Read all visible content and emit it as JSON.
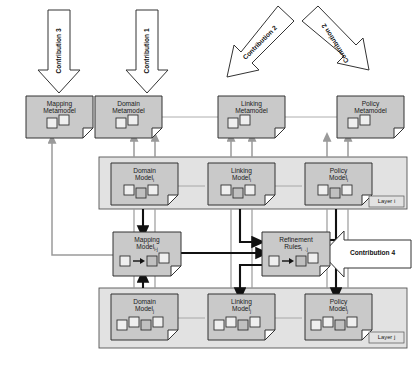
{
  "diagram": {
    "colors": {
      "doc_fill": "#c9c9c9",
      "doc_stroke": "#333333",
      "group_fill": "#e2e2e2",
      "group_stroke": "#555555",
      "arrow_gray": "#9a9a9a",
      "arrow_black": "#111111",
      "line_gray": "#9a9a9a",
      "contrib_fill": "#ffffff",
      "contrib_stroke": "#333333",
      "text": "#1a1a1a",
      "background": "#ffffff"
    },
    "contributions": [
      {
        "id": "contribution-3",
        "label": "Contribution 3",
        "direction": "down",
        "target": "Mapping Metamodel"
      },
      {
        "id": "contribution-1",
        "label": "Contribution 1",
        "direction": "down",
        "target": "Domain Metamodel"
      },
      {
        "id": "contribution-2-left",
        "label": "Contribution 2",
        "direction": "down-left",
        "target": "Linking Metamodel"
      },
      {
        "id": "contribution-2-right",
        "label": "Contribution 2",
        "direction": "down-right",
        "target": "Policy Metamodel"
      },
      {
        "id": "contribution-4",
        "label": "Contribution 4",
        "direction": "left",
        "target": "Refinement Rules"
      }
    ],
    "metamodels": [
      {
        "id": "mapping-metamodel",
        "line1": "Mapping",
        "line2": "Metamodel",
        "subscript": "",
        "shapes": 2
      },
      {
        "id": "domain-metamodel",
        "line1": "Domain",
        "line2": "Metamodel",
        "subscript": "",
        "shapes": 2
      },
      {
        "id": "linking-metamodel",
        "line1": "Linking",
        "line2": "Metamodel",
        "subscript": "",
        "shapes": 2
      },
      {
        "id": "policy-metamodel",
        "line1": "Policy",
        "line2": "Metamodel",
        "subscript": "",
        "shapes": 2
      }
    ],
    "layers": [
      {
        "id": "layer-i",
        "label": "Layer i",
        "models": [
          {
            "id": "domain-model-i",
            "line1": "Domain",
            "line2": "Model",
            "subscript": "i",
            "shapes": 3
          },
          {
            "id": "linking-model-i",
            "line1": "Linking",
            "line2": "Model",
            "subscript": "i",
            "shapes": 3
          },
          {
            "id": "policy-model-i",
            "line1": "Policy",
            "line2": "Model",
            "subscript": "i",
            "shapes": 3
          }
        ]
      },
      {
        "id": "layer-j",
        "label": "Layer j",
        "models": [
          {
            "id": "domain-model-j",
            "line1": "Domain",
            "line2": "Model",
            "subscript": "j",
            "shapes": 4
          },
          {
            "id": "linking-model-j",
            "line1": "Linking",
            "line2": "Model",
            "subscript": "j",
            "shapes": 4
          },
          {
            "id": "policy-model-j",
            "line1": "Policy",
            "line2": "Model",
            "subscript": "j",
            "shapes": 4
          }
        ]
      }
    ],
    "middle": [
      {
        "id": "mapping-model",
        "line1": "Mapping",
        "line2": "Model",
        "subscript": "i-j",
        "shapes": 3,
        "has_maps_arrow": true
      },
      {
        "id": "refinement-rules",
        "line1": "Refinement",
        "line2": "Rules",
        "subscript": "i→j",
        "shapes": 3,
        "has_maps_arrow": true
      }
    ]
  }
}
